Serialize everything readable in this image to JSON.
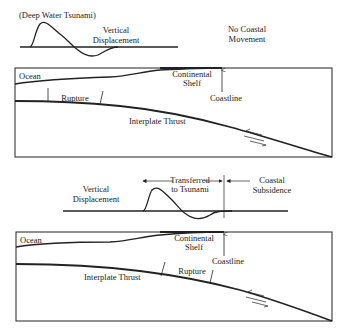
{
  "panel_top": {
    "title": "(Deep Water Tsunami)",
    "vertical_displacement_line1": "Vertical",
    "vertical_displacement_line2": "Displacement",
    "no_coastal_line1": "No Coastal",
    "no_coastal_line2": "Movement",
    "ocean": "Ocean",
    "shelf_line1": "Continental",
    "shelf_line2": "Shelf",
    "coastline": "Coastline",
    "rupture": "Rupture",
    "thrust": "Interplate Thrust"
  },
  "panel_bottom": {
    "vertical_displacement_line1": "Vertical",
    "vertical_displacement_line2": "Displacement",
    "transferred_line1": "Transferred",
    "transferred_line2": "to Tsunami",
    "subsidence_line1": "Coastal",
    "subsidence_line2": "Subsidence",
    "ocean": "Ocean",
    "shelf_line1": "Continental",
    "shelf_line2": "Shelf",
    "coastline": "Coastline",
    "rupture": "Rupture",
    "thrust": "Interplate Thrust"
  },
  "colors": {
    "line": "#222222",
    "background": "#ffffff"
  }
}
